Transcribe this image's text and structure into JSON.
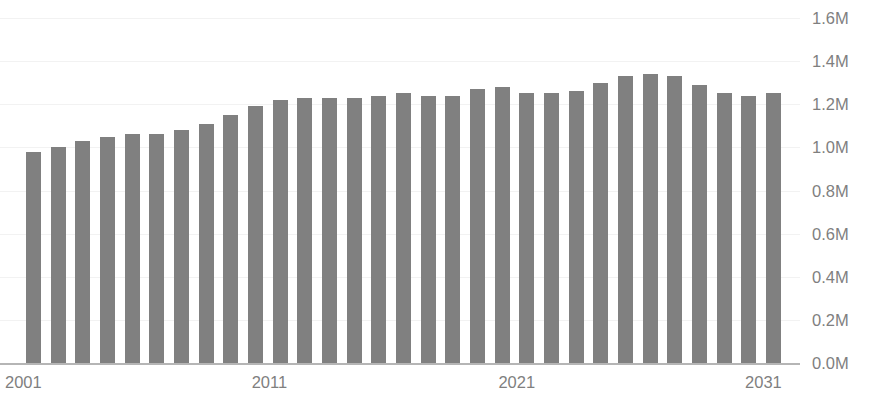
{
  "chart_data": {
    "type": "bar",
    "title": "",
    "xlabel": "",
    "ylabel": "",
    "ylim": [
      0,
      1600000
    ],
    "grid": true,
    "legend": "none",
    "bar_color": "#808080",
    "axis_text_color": "#7f7f7f",
    "y_ticks": [
      "0.0M",
      "0.2M",
      "0.4M",
      "0.6M",
      "0.8M",
      "1.0M",
      "1.2M",
      "1.4M",
      "1.6M"
    ],
    "y_tick_values": [
      0,
      200000,
      400000,
      600000,
      800000,
      1000000,
      1200000,
      1400000,
      1600000
    ],
    "x_ticks": [
      "2001",
      "2011",
      "2021",
      "2031"
    ],
    "x_tick_values": [
      2001,
      2011,
      2021,
      2031
    ],
    "categories": [
      "2001",
      "2002",
      "2003",
      "2004",
      "2005",
      "2006",
      "2007",
      "2008",
      "2009",
      "2010",
      "2011",
      "2012",
      "2013",
      "2014",
      "2015",
      "2016",
      "2017",
      "2018",
      "2019",
      "2020",
      "2021",
      "2022",
      "2023",
      "2024",
      "2025",
      "2026",
      "2027",
      "2028",
      "2029",
      "2030",
      "2031"
    ],
    "values": [
      980000,
      1000000,
      1030000,
      1050000,
      1060000,
      1060000,
      1080000,
      1110000,
      1150000,
      1190000,
      1220000,
      1230000,
      1230000,
      1230000,
      1240000,
      1250000,
      1240000,
      1240000,
      1270000,
      1280000,
      1250000,
      1250000,
      1260000,
      1300000,
      1330000,
      1340000,
      1330000,
      1290000,
      1250000,
      1240000,
      1250000
    ]
  }
}
